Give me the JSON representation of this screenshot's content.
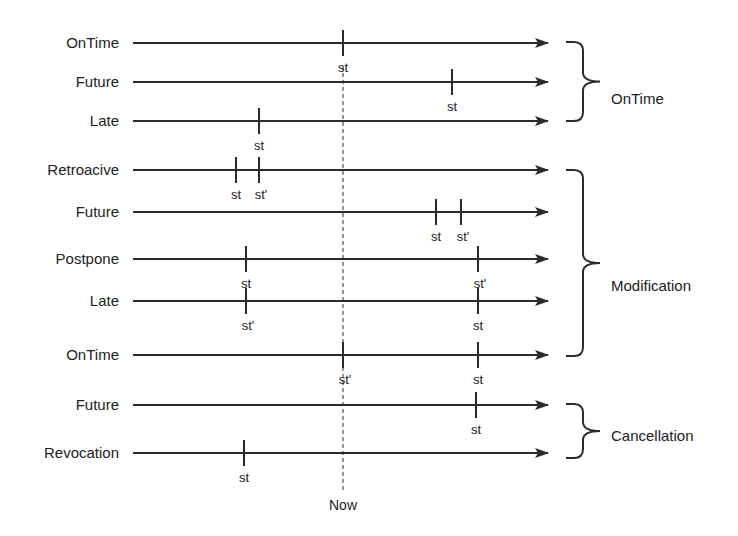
{
  "diagram": {
    "colors": {
      "stroke": "#2b2b2b",
      "text": "#222222",
      "background": "#ffffff"
    },
    "axis": {
      "line_start_x": 133,
      "arrow_tip_x": 548
    },
    "now": {
      "label": "Now",
      "x": 343,
      "y_start": 66,
      "y_end": 490,
      "label_y": 510
    },
    "rows": [
      {
        "label": "OnTime",
        "y": 43,
        "ticks": [
          {
            "x": 343,
            "label": "st"
          }
        ]
      },
      {
        "label": "Future",
        "y": 82,
        "ticks": [
          {
            "x": 452,
            "label": "st"
          }
        ]
      },
      {
        "label": "Late",
        "y": 121,
        "ticks": [
          {
            "x": 259,
            "label": "st"
          }
        ]
      },
      {
        "label": "Retroacive",
        "y": 170,
        "ticks": [
          {
            "x": 236,
            "label": "st"
          },
          {
            "x": 259,
            "label": "st'"
          }
        ]
      },
      {
        "label": "Future",
        "y": 212,
        "ticks": [
          {
            "x": 436,
            "label": "st"
          },
          {
            "x": 461,
            "label": "st'"
          }
        ]
      },
      {
        "label": "Postpone",
        "y": 259,
        "ticks": [
          {
            "x": 246,
            "label": "st"
          },
          {
            "x": 478,
            "label": "st'"
          }
        ]
      },
      {
        "label": "Late",
        "y": 301,
        "ticks": [
          {
            "x": 246,
            "label": "st'"
          },
          {
            "x": 478,
            "label": "st"
          }
        ]
      },
      {
        "label": "OnTime",
        "y": 355,
        "ticks": [
          {
            "x": 343,
            "label": "st'"
          },
          {
            "x": 478,
            "label": "st"
          }
        ]
      },
      {
        "label": "Future",
        "y": 405,
        "ticks": [
          {
            "x": 476,
            "label": "st"
          }
        ]
      },
      {
        "label": "Revocation",
        "y": 453,
        "ticks": [
          {
            "x": 244,
            "label": "st"
          }
        ]
      }
    ],
    "groups": [
      {
        "label": "OnTime",
        "y_top": 42,
        "y_bottom": 121,
        "label_y": 104
      },
      {
        "label": "Modification",
        "y_top": 170,
        "y_bottom": 356,
        "label_y": 291
      },
      {
        "label": "Cancellation",
        "y_top": 404,
        "y_bottom": 458,
        "label_y": 441
      }
    ]
  }
}
